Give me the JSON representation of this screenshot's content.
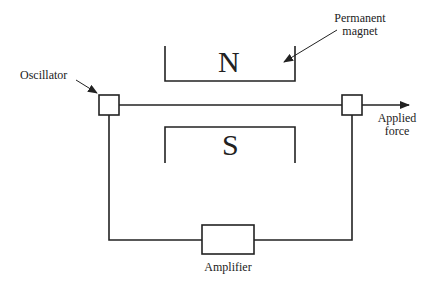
{
  "diagram": {
    "labels": {
      "oscillator": "Oscillator",
      "permanent_magnet_line1": "Permanent",
      "permanent_magnet_line2": "magnet",
      "applied_force_line1": "Applied",
      "applied_force_line2": "force",
      "amplifier": "Amplifier",
      "north_pole": "N",
      "south_pole": "S"
    },
    "colors": {
      "line": "#222222",
      "background": "#ffffff"
    }
  }
}
